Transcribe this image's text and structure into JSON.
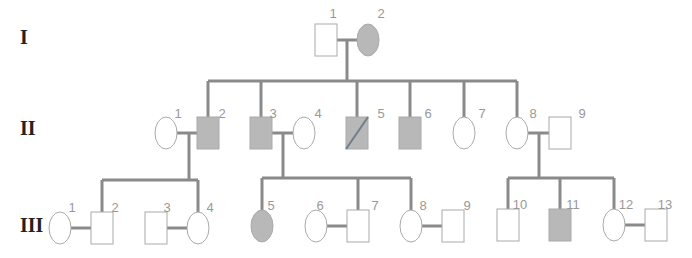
{
  "colors": {
    "affected": "#b8b8b8",
    "unaffected": "#ffffff",
    "line": "#8a8a8a",
    "label": "#999999",
    "generation": "#222222"
  },
  "generations": [
    {
      "label": "I",
      "y": 44
    },
    {
      "label": "II",
      "y": 135
    },
    {
      "label": "III",
      "y": 232
    }
  ],
  "individuals": [
    {
      "id": "I-1",
      "num": "1",
      "sex": "male",
      "status": "unaffected",
      "x": 326,
      "y": 40,
      "lx": 333,
      "ly": 18
    },
    {
      "id": "I-2",
      "num": "2",
      "sex": "female",
      "status": "affected",
      "x": 368,
      "y": 40,
      "lx": 381,
      "ly": 18
    },
    {
      "id": "II-1",
      "num": "1",
      "sex": "female",
      "status": "unaffected",
      "x": 166,
      "y": 133,
      "lx": 178,
      "ly": 118
    },
    {
      "id": "II-2",
      "num": "2",
      "sex": "male",
      "status": "affected",
      "x": 208,
      "y": 133,
      "lx": 222,
      "ly": 118
    },
    {
      "id": "II-3",
      "num": "3",
      "sex": "male",
      "status": "affected",
      "x": 261,
      "y": 133,
      "lx": 273,
      "ly": 118
    },
    {
      "id": "II-4",
      "num": "4",
      "sex": "female",
      "status": "unaffected",
      "x": 304,
      "y": 133,
      "lx": 318,
      "ly": 118
    },
    {
      "id": "II-5",
      "num": "5",
      "sex": "male",
      "status": "deceased-affected",
      "x": 357,
      "y": 133,
      "lx": 381,
      "ly": 118
    },
    {
      "id": "II-6",
      "num": "6",
      "sex": "male",
      "status": "affected",
      "x": 410,
      "y": 133,
      "lx": 428,
      "ly": 118
    },
    {
      "id": "II-7",
      "num": "7",
      "sex": "female",
      "status": "unaffected",
      "x": 464,
      "y": 133,
      "lx": 482,
      "ly": 118
    },
    {
      "id": "II-8",
      "num": "8",
      "sex": "female",
      "status": "unaffected",
      "x": 517,
      "y": 133,
      "lx": 533,
      "ly": 118
    },
    {
      "id": "II-9",
      "num": "9",
      "sex": "male",
      "status": "unaffected",
      "x": 560,
      "y": 133,
      "lx": 582,
      "ly": 118
    },
    {
      "id": "III-1",
      "num": "1",
      "sex": "female",
      "status": "unaffected",
      "x": 60,
      "y": 228,
      "lx": 72,
      "ly": 212
    },
    {
      "id": "III-2",
      "num": "2",
      "sex": "male",
      "status": "unaffected",
      "x": 102,
      "y": 228,
      "lx": 115,
      "ly": 212
    },
    {
      "id": "III-3",
      "num": "3",
      "sex": "male",
      "status": "unaffected",
      "x": 156,
      "y": 228,
      "lx": 167,
      "ly": 212
    },
    {
      "id": "III-4",
      "num": "4",
      "sex": "female",
      "status": "unaffected",
      "x": 198,
      "y": 228,
      "lx": 210,
      "ly": 212
    },
    {
      "id": "III-5",
      "num": "5",
      "sex": "female",
      "status": "affected",
      "x": 262,
      "y": 226,
      "lx": 271,
      "ly": 210
    },
    {
      "id": "III-6",
      "num": "6",
      "sex": "female",
      "status": "unaffected",
      "x": 316,
      "y": 226,
      "lx": 320,
      "ly": 210
    },
    {
      "id": "III-7",
      "num": "7",
      "sex": "male",
      "status": "unaffected",
      "x": 358,
      "y": 226,
      "lx": 375,
      "ly": 210
    },
    {
      "id": "III-8",
      "num": "8",
      "sex": "female",
      "status": "unaffected",
      "x": 411,
      "y": 226,
      "lx": 423,
      "ly": 210
    },
    {
      "id": "III-9",
      "num": "9",
      "sex": "male",
      "status": "unaffected",
      "x": 453,
      "y": 226,
      "lx": 467,
      "ly": 210
    },
    {
      "id": "III-10",
      "num": "10",
      "sex": "male",
      "status": "unaffected",
      "x": 508,
      "y": 225,
      "lx": 520,
      "ly": 209
    },
    {
      "id": "III-11",
      "num": "11",
      "sex": "male",
      "status": "affected",
      "x": 560,
      "y": 225,
      "lx": 573,
      "ly": 209
    },
    {
      "id": "III-12",
      "num": "12",
      "sex": "female",
      "status": "unaffected",
      "x": 614,
      "y": 225,
      "lx": 626,
      "ly": 209
    },
    {
      "id": "III-13",
      "num": "13",
      "sex": "male",
      "status": "unaffected",
      "x": 656,
      "y": 225,
      "lx": 665,
      "ly": 209
    }
  ],
  "lines": [
    {
      "name": "mating-I1-I2",
      "d": "M337 40 H357"
    },
    {
      "name": "descent-I",
      "d": "M347 40 V81"
    },
    {
      "name": "sibship-II",
      "d": "M208 81 H517"
    },
    {
      "name": "drop-II2",
      "d": "M208 81 V117"
    },
    {
      "name": "drop-II3",
      "d": "M261 81 V117"
    },
    {
      "name": "drop-II5",
      "d": "M357 81 V117"
    },
    {
      "name": "drop-II6",
      "d": "M410 81 V117"
    },
    {
      "name": "drop-II7",
      "d": "M464 81 V117"
    },
    {
      "name": "drop-II8",
      "d": "M517 81 V117"
    },
    {
      "name": "mating-II1-II2",
      "d": "M176 133 H197"
    },
    {
      "name": "descent-II1-II2",
      "d": "M189 133 V180"
    },
    {
      "name": "sibship-III-a",
      "d": "M102 180 H198"
    },
    {
      "name": "drop-III2",
      "d": "M102 180 V212"
    },
    {
      "name": "drop-III4",
      "d": "M198 180 V212"
    },
    {
      "name": "mating-II3-II4",
      "d": "M272 133 H294"
    },
    {
      "name": "descent-II3-II4",
      "d": "M283 133 V178"
    },
    {
      "name": "sibship-III-b",
      "d": "M262 178 H411"
    },
    {
      "name": "drop-III5",
      "d": "M262 178 V212"
    },
    {
      "name": "drop-III7",
      "d": "M358 178 V210"
    },
    {
      "name": "drop-III8",
      "d": "M411 178 V210"
    },
    {
      "name": "mating-II8-II9",
      "d": "M527 133 H549"
    },
    {
      "name": "descent-II8-II9",
      "d": "M539 133 V178"
    },
    {
      "name": "sibship-III-c",
      "d": "M508 178 H614"
    },
    {
      "name": "drop-III10",
      "d": "M508 178 V209"
    },
    {
      "name": "drop-III11",
      "d": "M560 178 V209"
    },
    {
      "name": "drop-III12",
      "d": "M614 178 V209"
    },
    {
      "name": "mating-III1-III2",
      "d": "M70 228 H91"
    },
    {
      "name": "mating-III3-III4",
      "d": "M167 228 H188"
    },
    {
      "name": "mating-III6-III7",
      "d": "M326 226 H347"
    },
    {
      "name": "mating-III8-III9",
      "d": "M421 226 H442"
    },
    {
      "name": "mating-III12-III13",
      "d": "M624 225 H645"
    }
  ]
}
